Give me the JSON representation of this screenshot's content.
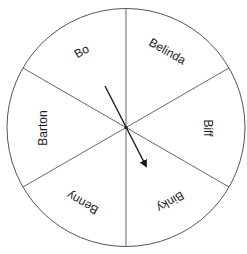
{
  "diagram": {
    "type": "spinner-wheel",
    "center": [
      126,
      127.5
    ],
    "radius": 119,
    "segments": [
      {
        "name": "Bo",
        "label": "Bo"
      },
      {
        "name": "Belinda",
        "label": "Belinda"
      },
      {
        "name": "Biff",
        "label": "Biff"
      },
      {
        "name": "Binky",
        "label": "Binky"
      },
      {
        "name": "Benny",
        "label": "Benny"
      },
      {
        "name": "Barton",
        "label": "Barton"
      }
    ],
    "pointer": {
      "points_to": "Binky"
    },
    "colors": {
      "stroke": "#555555",
      "arrow": "#1a1a1a",
      "text": "#1a1a1a",
      "background": "#ffffff"
    }
  }
}
